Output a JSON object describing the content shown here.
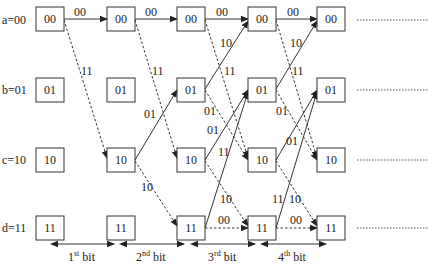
{
  "diagram": {
    "type": "trellis",
    "states": [
      {
        "id": "a",
        "label": "a=00",
        "code": "00"
      },
      {
        "id": "b",
        "label": "b=01",
        "code": "01"
      },
      {
        "id": "c",
        "label": "c=10",
        "code": "10"
      },
      {
        "id": "d",
        "label": "d=11",
        "code": "11"
      }
    ],
    "columns": 5,
    "transitions": [
      {
        "from": "a",
        "to": "a",
        "output": "00",
        "style": "solid"
      },
      {
        "from": "a",
        "to": "c",
        "output": "11",
        "style": "dashed"
      },
      {
        "from": "b",
        "to": "a",
        "output": "10",
        "style": "solid"
      },
      {
        "from": "b",
        "to": "c",
        "output": "01",
        "style": "dashed"
      },
      {
        "from": "c",
        "to": "b",
        "output": "01",
        "style": "solid"
      },
      {
        "from": "c",
        "to": "d",
        "output": "10",
        "style": "dashed"
      },
      {
        "from": "d",
        "to": "b",
        "output": "11",
        "style": "solid"
      },
      {
        "from": "d",
        "to": "d",
        "output": "00",
        "style": "dashed"
      }
    ],
    "bit_intervals": [
      {
        "label": "1",
        "sup": "st",
        "suffix": " bit"
      },
      {
        "label": "2",
        "sup": "nd",
        "suffix": " bit"
      },
      {
        "label": "3",
        "sup": "rd",
        "suffix": " bit"
      },
      {
        "label": "4",
        "sup": "th",
        "suffix": " bit"
      }
    ],
    "continuation": "dotted-line"
  }
}
